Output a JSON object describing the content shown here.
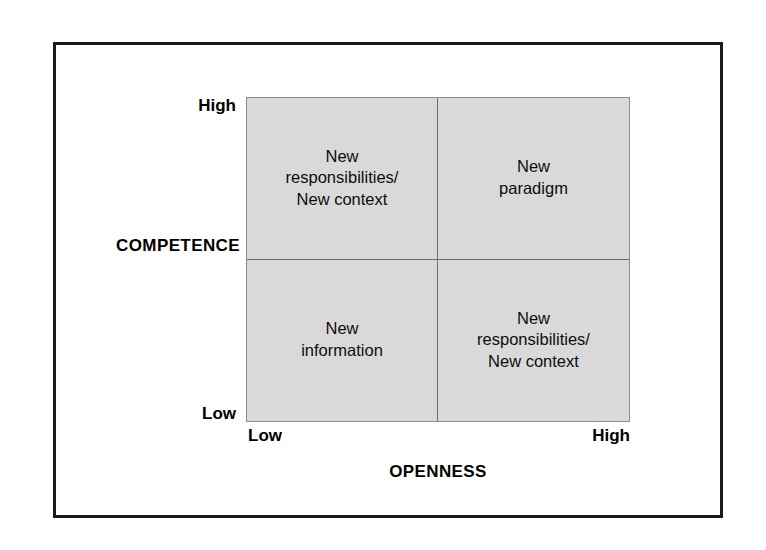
{
  "figure": {
    "kind": "two-by-two-matrix-diagram",
    "background_color": "#ffffff",
    "frame_color": "#1a1a1a",
    "grid_fill_color": "#d9d9d9",
    "grid_line_color": "#6e6e6e",
    "text_color": "#0d0d0d"
  },
  "axes": {
    "y": {
      "title": "COMPETENCE",
      "low_label": "Low",
      "high_label": "High"
    },
    "x": {
      "title": "OPENNESS",
      "low_label": "Low",
      "high_label": "High"
    }
  },
  "quadrants": [
    {
      "id": "high-competence-low-openness",
      "position": "top-left",
      "competence": "High",
      "openness": "Low",
      "label": "New\nresponsibilities/\nNew context"
    },
    {
      "id": "high-competence-high-openness",
      "position": "top-right",
      "competence": "High",
      "openness": "High",
      "label": "New\nparadigm"
    },
    {
      "id": "low-competence-low-openness",
      "position": "bottom-left",
      "competence": "Low",
      "openness": "Low",
      "label": "New\ninformation"
    },
    {
      "id": "low-competence-high-openness",
      "position": "bottom-right",
      "competence": "Low",
      "openness": "High",
      "label": "New\nresponsibilities/\nNew context"
    }
  ],
  "chart_data": {
    "type": "table",
    "title": "",
    "xlabel": "OPENNESS",
    "ylabel": "COMPETENCE",
    "x_tick_labels": [
      "Low",
      "High"
    ],
    "y_tick_labels": [
      "Low",
      "High"
    ],
    "grid": true,
    "legend": null,
    "categories": [
      "Low openness",
      "High openness"
    ],
    "rows": [
      "High competence",
      "Low competence"
    ],
    "cells": [
      [
        "New responsibilities/ New context",
        "New paradigm"
      ],
      [
        "New information",
        "New responsibilities/ New context"
      ]
    ]
  }
}
